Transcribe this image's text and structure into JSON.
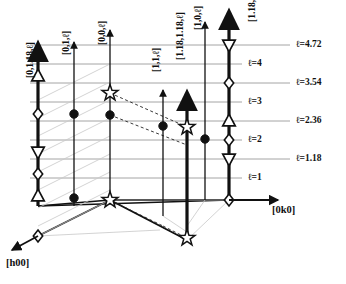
{
  "figure": {
    "type": "reciprocal-space-rod-diagram"
  },
  "axes": {
    "horizontal": {
      "label": "[0k0]",
      "direction": "right"
    },
    "depth": {
      "label": "[h00]",
      "direction": "down-left"
    },
    "vertical": {
      "label": "l",
      "direction": "up"
    }
  },
  "gridlines": [
    {
      "id": "l1",
      "label": "ℓ=1",
      "value": 1,
      "y": 178,
      "x_start": 30,
      "x_end": 242,
      "kind": "integer"
    },
    {
      "id": "l1p18",
      "label": "ℓ=1.18",
      "value": 1.18,
      "y": 159,
      "x_start": 30,
      "x_end": 290,
      "kind": "incommensurate"
    },
    {
      "id": "l2",
      "label": "ℓ=2",
      "value": 2,
      "y": 140,
      "x_start": 30,
      "x_end": 242,
      "kind": "integer"
    },
    {
      "id": "l2p36",
      "label": "ℓ=2.36",
      "value": 2.36,
      "y": 121,
      "x_start": 30,
      "x_end": 290,
      "kind": "incommensurate"
    },
    {
      "id": "l3",
      "label": "ℓ=3",
      "value": 3,
      "y": 102,
      "x_start": 30,
      "x_end": 242,
      "kind": "integer"
    },
    {
      "id": "l3p54",
      "label": "ℓ=3.54",
      "value": 3.54,
      "y": 83,
      "x_start": 30,
      "x_end": 290,
      "kind": "incommensurate"
    },
    {
      "id": "l4",
      "label": "ℓ=4",
      "value": 4,
      "y": 64,
      "x_start": 30,
      "x_end": 242,
      "kind": "integer"
    },
    {
      "id": "l4p72",
      "label": "ℓ=4.72",
      "value": 4.72,
      "y": 45,
      "x_start": 30,
      "x_end": 290,
      "kind": "incommensurate"
    }
  ],
  "gridline_labels": [
    {
      "text": "ℓ=4.72",
      "x": 296,
      "y": 40
    },
    {
      "text": "ℓ=4",
      "x": 248,
      "y": 59
    },
    {
      "text": "ℓ=3.54",
      "x": 296,
      "y": 78
    },
    {
      "text": "ℓ=3",
      "x": 248,
      "y": 97
    },
    {
      "text": "ℓ=2.36",
      "x": 296,
      "y": 116
    },
    {
      "text": "ℓ=2",
      "x": 248,
      "y": 135
    },
    {
      "text": "ℓ=1.18",
      "x": 296,
      "y": 154
    },
    {
      "text": "ℓ=1",
      "x": 248,
      "y": 173
    }
  ],
  "rods": [
    {
      "id": "rod-0-118-l",
      "label": "[0,1.18,ℓ]",
      "label_x": 26,
      "label_y": 78,
      "x": 38,
      "y_top": 46,
      "y_bottom": 206,
      "weight": "thick",
      "markers": [
        {
          "shape": "up-triangle",
          "y": 76
        },
        {
          "shape": "diamond",
          "y": 114
        },
        {
          "shape": "down-triangle",
          "y": 152
        },
        {
          "shape": "diamond",
          "y": 174
        },
        {
          "shape": "up-triangle",
          "y": 196
        },
        {
          "shape": "diamond",
          "y": 236
        }
      ]
    },
    {
      "id": "rod-0-1-l",
      "label": "[0,1,ℓ]",
      "label_x": 62,
      "label_y": 55,
      "x": 74,
      "y_top": 42,
      "y_bottom": 206,
      "weight": "thin",
      "markers": [
        {
          "shape": "filled-circle",
          "y": 114
        },
        {
          "shape": "filled-circle",
          "y": 198
        }
      ]
    },
    {
      "id": "rod-0-0-l",
      "label": "[0,0,ℓ]",
      "label_x": 98,
      "label_y": 45,
      "x": 110,
      "y_top": 30,
      "y_bottom": 200,
      "weight": "thin",
      "markers": [
        {
          "shape": "star",
          "y": 93
        },
        {
          "shape": "filled-circle",
          "y": 115
        },
        {
          "shape": "star",
          "y": 200
        }
      ]
    },
    {
      "id": "rod-1-1-l",
      "label": "[1,1,ℓ]",
      "label_x": 152,
      "label_y": 72,
      "x": 163,
      "y_top": 90,
      "y_bottom": 216,
      "weight": "thin",
      "markers": [
        {
          "shape": "filled-circle",
          "y": 126
        }
      ]
    },
    {
      "id": "rod-118-118-l",
      "label": "[1.18,1.18,ℓ]",
      "label_x": 176,
      "label_y": 60,
      "x": 187,
      "y_top": 95,
      "y_bottom": 240,
      "weight": "thick",
      "markers": [
        {
          "shape": "star",
          "y": 127
        },
        {
          "shape": "star",
          "y": 238
        }
      ]
    },
    {
      "id": "rod-1-0-l",
      "label": "[1,0,ℓ]",
      "label_x": 194,
      "label_y": 30,
      "x": 205,
      "y_top": 22,
      "y_bottom": 200,
      "weight": "thin",
      "markers": [
        {
          "shape": "filled-circle",
          "y": 139
        }
      ]
    },
    {
      "id": "rod-118-0-l",
      "label": "[1.18,0,ℓ]",
      "label_x": 236,
      "label_y": 22,
      "x": 229,
      "y_top": 14,
      "y_bottom": 200,
      "weight": "thick",
      "markers": [
        {
          "shape": "down-triangle",
          "y": 45
        },
        {
          "shape": "diamond",
          "y": 83
        },
        {
          "shape": "up-triangle",
          "y": 121
        },
        {
          "shape": "diamond",
          "y": 140
        },
        {
          "shape": "down-triangle",
          "y": 159
        },
        {
          "shape": "diamond",
          "y": 200
        }
      ]
    }
  ],
  "dashed_connectors": [
    {
      "from_x": 110,
      "from_y": 93,
      "to_x": 187,
      "to_y": 127
    },
    {
      "from_x": 110,
      "from_y": 115,
      "to_x": 187,
      "to_y": 145
    },
    {
      "from_x": 110,
      "from_y": 200,
      "to_x": 163,
      "to_y": 226
    },
    {
      "from_x": 163,
      "from_y": 226,
      "to_x": 187,
      "to_y": 238
    }
  ]
}
